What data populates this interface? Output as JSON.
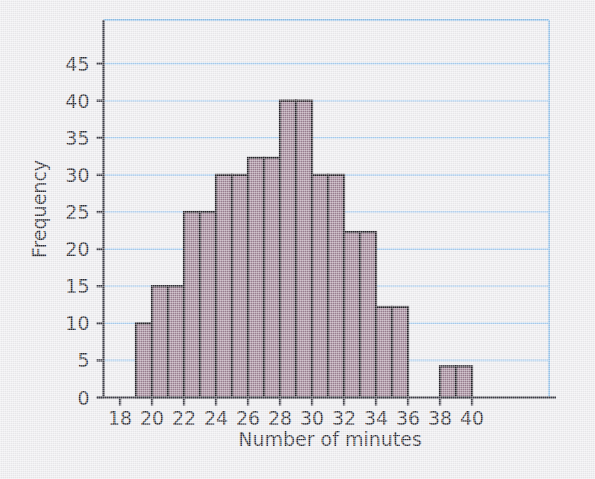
{
  "figure": {
    "background_color": "#edecef",
    "plot_border_color": "#8fbfe8"
  },
  "chart_data": {
    "type": "bar",
    "title": "",
    "subtitle": "",
    "xlabel": "Number of minutes",
    "ylabel": "Frequency",
    "xlim": [
      18,
      41
    ],
    "ylim": [
      0,
      48
    ],
    "grid": true,
    "grid_axis": "y",
    "grid_color": "#a8cdf0",
    "legend": null,
    "bar_fill_color": "#9b7f92",
    "bar_edge_color": "#231f26",
    "axis_color": "#3c3c46",
    "xticks": [
      18,
      20,
      22,
      24,
      26,
      28,
      30,
      32,
      34,
      36,
      38,
      40
    ],
    "xtick_labels": [
      "18",
      "20",
      "22",
      "24",
      "26",
      "28",
      "30",
      "32",
      "34",
      "36",
      "38",
      "40"
    ],
    "yticks": [
      0,
      5,
      10,
      15,
      20,
      25,
      30,
      35,
      40,
      45
    ],
    "ytick_labels": [
      "0",
      "5",
      "10",
      "15",
      "20",
      "25",
      "30",
      "35",
      "40",
      "45"
    ],
    "bin_width": 1,
    "bins": [
      {
        "x_start": 19,
        "x_end": 20,
        "value": 10
      },
      {
        "x_start": 20,
        "x_end": 21,
        "value": 15
      },
      {
        "x_start": 21,
        "x_end": 22,
        "value": 15
      },
      {
        "x_start": 22,
        "x_end": 23,
        "value": 25
      },
      {
        "x_start": 23,
        "x_end": 24,
        "value": 25
      },
      {
        "x_start": 24,
        "x_end": 25,
        "value": 30
      },
      {
        "x_start": 25,
        "x_end": 26,
        "value": 30
      },
      {
        "x_start": 26,
        "x_end": 27,
        "value": 32.3
      },
      {
        "x_start": 27,
        "x_end": 28,
        "value": 32.3
      },
      {
        "x_start": 28,
        "x_end": 29,
        "value": 40
      },
      {
        "x_start": 29,
        "x_end": 30,
        "value": 40
      },
      {
        "x_start": 30,
        "x_end": 31,
        "value": 30
      },
      {
        "x_start": 31,
        "x_end": 32,
        "value": 30
      },
      {
        "x_start": 32,
        "x_end": 33,
        "value": 22.3
      },
      {
        "x_start": 33,
        "x_end": 34,
        "value": 22.3
      },
      {
        "x_start": 34,
        "x_end": 35,
        "value": 12.2
      },
      {
        "x_start": 35,
        "x_end": 36,
        "value": 12.2
      },
      {
        "x_start": 38,
        "x_end": 39,
        "value": 4.2
      },
      {
        "x_start": 39,
        "x_end": 40,
        "value": 4.2
      }
    ],
    "categories": [
      "19-21",
      "21-23",
      "23-25",
      "25-27",
      "27-29",
      "29-31",
      "31-33",
      "33-35",
      "35-37",
      "37-39",
      "39-41"
    ],
    "values": [
      10,
      15,
      25,
      30,
      32.3,
      40,
      30,
      22.3,
      12.2,
      0,
      4.2
    ]
  }
}
